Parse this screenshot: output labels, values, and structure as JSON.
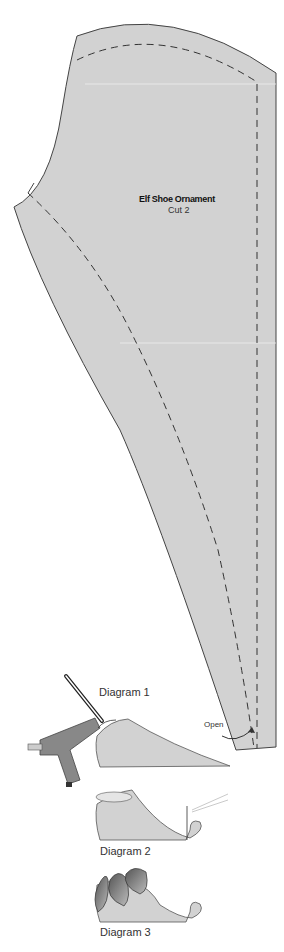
{
  "pattern": {
    "title": "Elf Shoe Ornament",
    "instruction": "Cut 2",
    "fill_color": "#d2d2d2",
    "outline_color": "#444444",
    "seam_line_style": "dashed"
  },
  "annotations": {
    "open_label": "Open"
  },
  "diagrams": [
    {
      "label": "Diagram 1",
      "depicts": "hot glue gun gluing shoe top edge"
    },
    {
      "label": "Diagram 2",
      "depicts": "needle and thread sewing curled toe"
    },
    {
      "label": "Diagram 3",
      "depicts": "leaf flaps folded over shoe opening"
    }
  ]
}
